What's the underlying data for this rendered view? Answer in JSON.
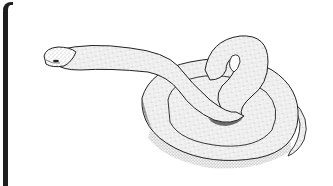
{
  "image": {
    "subject": "coiled snake",
    "style": "stippled pen-and-ink illustration",
    "colors": {
      "background": "#ffffff",
      "ink": "#1e1e1e",
      "stipple": "#555555",
      "border": "#1e1e1e"
    }
  }
}
